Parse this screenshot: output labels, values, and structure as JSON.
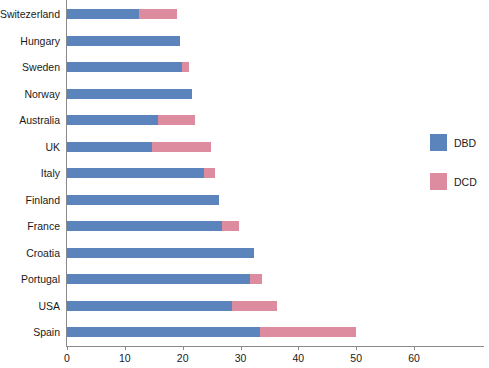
{
  "chart_data": {
    "type": "bar",
    "orientation": "horizontal",
    "stacked": true,
    "title": "",
    "xlabel": "",
    "ylabel": "",
    "xlim": [
      0,
      60
    ],
    "xticks": [
      0,
      10,
      20,
      30,
      40,
      50,
      60
    ],
    "xtick_labels": [
      "0",
      "10",
      "20",
      "30",
      "40",
      "50",
      "60"
    ],
    "grid": false,
    "legend_position": "right",
    "categories": [
      "Switezerland",
      "Hungary",
      "Sweden",
      "Norway",
      "Australia",
      "UK",
      "Italy",
      "Finland",
      "France",
      "Croatia",
      "Portugal",
      "USA",
      "Spain"
    ],
    "series": [
      {
        "name": "DBD",
        "color": "#5b84bd",
        "values": [
          12.5,
          19.5,
          19.8,
          21.6,
          15.8,
          14.7,
          23.7,
          26.3,
          26.8,
          32.3,
          31.7,
          28.5,
          33.4
        ]
      },
      {
        "name": "DCD",
        "color": "#dd8ca0",
        "values": [
          6.5,
          0,
          1.3,
          0,
          6.3,
          10.2,
          1.9,
          0,
          2.9,
          0,
          2.0,
          7.8,
          16.6
        ]
      }
    ],
    "totals": [
      19.0,
      19.5,
      21.1,
      21.6,
      22.1,
      24.9,
      25.6,
      26.3,
      29.7,
      32.3,
      33.7,
      36.3,
      50.0
    ]
  },
  "legend": {
    "items": [
      {
        "label": "DBD",
        "color": "#5b84bd"
      },
      {
        "label": "DCD",
        "color": "#dd8ca0"
      }
    ]
  }
}
